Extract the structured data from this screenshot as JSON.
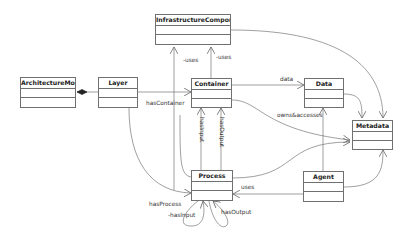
{
  "diagram": {
    "type": "UML class diagram",
    "classes": [
      {
        "id": "architecture_model",
        "name": "ArchitectureModel"
      },
      {
        "id": "layer",
        "name": "Layer"
      },
      {
        "id": "infrastructure_component",
        "name": "InfrastructureComponent"
      },
      {
        "id": "container",
        "name": "Container"
      },
      {
        "id": "data",
        "name": "Data"
      },
      {
        "id": "metadata",
        "name": "Metadata"
      },
      {
        "id": "process",
        "name": "Process"
      },
      {
        "id": "agent",
        "name": "Agent"
      }
    ],
    "labels": {
      "has_container": "hasContainer",
      "uses_layer_infra": "-uses",
      "uses_container_infra": "-uses",
      "data": "data",
      "owns_accesses": "owns&accesses",
      "has_input_container": "hasInput",
      "has_output_container": "hasOutput",
      "uses_agent_process": "uses",
      "has_process": "hasProcess",
      "has_input_self": "-hasInput",
      "has_output_self": "hasOutput"
    },
    "relations": [
      {
        "from": "ArchitectureModel",
        "to": "Layer",
        "kind": "composition"
      },
      {
        "from": "Layer",
        "to": "Container",
        "label": "hasContainer"
      },
      {
        "from": "Layer",
        "to": "InfrastructureComponent",
        "label": "-uses"
      },
      {
        "from": "Layer",
        "to": "Process",
        "label": "hasProcess"
      },
      {
        "from": "Container",
        "to": "InfrastructureComponent",
        "label": "-uses"
      },
      {
        "from": "Container",
        "to": "Data",
        "label": "data"
      },
      {
        "from": "Container",
        "to": "Metadata",
        "label": "owns&accesses"
      },
      {
        "from": "Process",
        "to": "Container",
        "label": "hasInput"
      },
      {
        "from": "Process",
        "to": "Container",
        "label": "hasOutput"
      },
      {
        "from": "Process",
        "to": "Metadata"
      },
      {
        "from": "Process",
        "to": "Process",
        "label": "-hasInput"
      },
      {
        "from": "Process",
        "to": "Process",
        "label": "hasOutput"
      },
      {
        "from": "Agent",
        "to": "Process",
        "label": "uses"
      },
      {
        "from": "Agent",
        "to": "Data"
      },
      {
        "from": "Agent",
        "to": "Metadata"
      },
      {
        "from": "Data",
        "to": "Metadata"
      },
      {
        "from": "InfrastructureComponent",
        "to": "Metadata"
      }
    ]
  }
}
